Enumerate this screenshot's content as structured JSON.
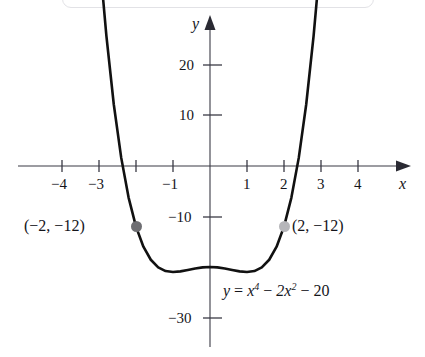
{
  "figure": {
    "name": "quartic-graph",
    "background": "#ffffff",
    "curve_color": "#111111",
    "axis_color": "#3a3a44"
  },
  "axes": {
    "x_axis_label": "x",
    "y_axis_label": "y",
    "x_tick_labels": [
      "−4",
      "−3",
      "−1",
      "1",
      "2",
      "3",
      "4"
    ],
    "y_tick_labels": [
      "20",
      "10",
      "−10",
      "−30"
    ]
  },
  "points": [
    {
      "label": "(−2, −12)",
      "x": -2,
      "y": -12,
      "color": "#6e6e72"
    },
    {
      "label": "(2, −12)",
      "x": 2,
      "y": -12,
      "color": "#b6b6ba"
    }
  ],
  "equation": {
    "lhs": "y",
    "eq": " = ",
    "term1": "x",
    "term1_exp": "4",
    "minus1": " − ",
    "term2": "2x",
    "term2_exp": "2",
    "minus2": " − ",
    "term3": "20",
    "plain": "y = x⁴ − 2x² − 20"
  },
  "chart_data": {
    "type": "line",
    "title": "",
    "subtitle": "",
    "xlabel": "x",
    "ylabel": "y",
    "equation": "y = x^4 - 2x^2 - 20",
    "grid": false,
    "legend": "none",
    "xlim": [
      -4.9,
      4.9
    ],
    "ylim": [
      -34,
      28
    ],
    "x_ticks": [
      -4,
      -3,
      -1,
      1,
      2,
      3,
      4
    ],
    "x_tick_labels": [
      "−4",
      "−3",
      "−1",
      "1",
      "2",
      "3",
      "4"
    ],
    "x_ticks_unlabeled": [
      -2
    ],
    "y_ticks": [
      20,
      10,
      -10,
      -30
    ],
    "y_tick_labels": [
      "20",
      "10",
      "−10",
      "−30"
    ],
    "x_domain_plotted": [
      -2.92,
      2.92
    ],
    "series": [
      {
        "name": "y = x^4 - 2x^2 - 20",
        "color": "#111111",
        "x": [
          -2.92,
          -2.8,
          -2.6,
          -2.4,
          -2.2,
          -2.0,
          -1.8,
          -1.6,
          -1.4,
          -1.2,
          -1.0,
          -0.8,
          -0.6,
          -0.4,
          -0.2,
          0.0,
          0.2,
          0.4,
          0.6,
          0.8,
          1.0,
          1.2,
          1.4,
          1.6,
          1.8,
          2.0,
          2.2,
          2.4,
          2.6,
          2.8,
          2.92
        ],
        "y": [
          29.6,
          19.4,
          9.2,
          1.6,
          -3.7,
          -12.0,
          -12.0,
          -16.5,
          -19.2,
          -20.8,
          -21.0,
          -20.9,
          -20.6,
          -20.3,
          -20.1,
          -20.0,
          -20.1,
          -20.3,
          -20.6,
          -20.9,
          -21.0,
          -20.8,
          -19.2,
          -16.5,
          -12.0,
          -12.0,
          -3.7,
          1.6,
          9.2,
          19.4,
          29.6
        ]
      }
    ],
    "annotated_points": [
      {
        "label": "(−2, −12)",
        "x": -2,
        "y": -12
      },
      {
        "label": "(2, −12)",
        "x": 2,
        "y": -12
      }
    ]
  }
}
